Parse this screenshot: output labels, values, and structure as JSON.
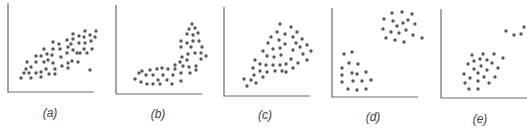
{
  "chart_data": {
    "type": "scatter",
    "title": "",
    "grid": false,
    "legend": null,
    "panels": [
      {
        "label": "(a)",
        "description": "positive linear correlation with one outlier",
        "axis": {
          "x0": 8,
          "y0": 92,
          "x1": 94,
          "ytop": 3
        },
        "label_pos": [
          50,
          117
        ],
        "points": [
          [
            21,
            78
          ],
          [
            26,
            69
          ],
          [
            24,
            73
          ],
          [
            31,
            78
          ],
          [
            29,
            73
          ],
          [
            27,
            62
          ],
          [
            31,
            67
          ],
          [
            36,
            56
          ],
          [
            36,
            62
          ],
          [
            36,
            73
          ],
          [
            41,
            56
          ],
          [
            41,
            72
          ],
          [
            41,
            77
          ],
          [
            44,
            49
          ],
          [
            44,
            62
          ],
          [
            46,
            69
          ],
          [
            47,
            54
          ],
          [
            48,
            60
          ],
          [
            49,
            74
          ],
          [
            53,
            42
          ],
          [
            53,
            49
          ],
          [
            52,
            55
          ],
          [
            53,
            63
          ],
          [
            55,
            69
          ],
          [
            55,
            74
          ],
          [
            59,
            44
          ],
          [
            60,
            49
          ],
          [
            61,
            57
          ],
          [
            62,
            66
          ],
          [
            67,
            40
          ],
          [
            68,
            47
          ],
          [
            67,
            53
          ],
          [
            68,
            63
          ],
          [
            68,
            68
          ],
          [
            73,
            34
          ],
          [
            73,
            39
          ],
          [
            71,
            44
          ],
          [
            72,
            61
          ],
          [
            79,
            36
          ],
          [
            79,
            43
          ],
          [
            77,
            53
          ],
          [
            78,
            62
          ],
          [
            85,
            31
          ],
          [
            84,
            37
          ],
          [
            85,
            43
          ],
          [
            84,
            49
          ],
          [
            87,
            53
          ],
          [
            90,
            35
          ],
          [
            91,
            41
          ],
          [
            92,
            49
          ],
          [
            96,
            31
          ],
          [
            95,
            37
          ],
          [
            90,
            70
          ],
          [
            80,
            53
          ],
          [
            73,
            50
          ]
        ]
      },
      {
        "label": "(b)",
        "description": "nonlinear (curved) relationship",
        "axis": {
          "x0": 116,
          "y0": 94,
          "x1": 202,
          "ytop": 5
        },
        "label_pos": [
          158,
          118
        ],
        "points": [
          [
            135,
            79
          ],
          [
            139,
            73
          ],
          [
            142,
            71
          ],
          [
            141,
            82
          ],
          [
            146,
            75
          ],
          [
            147,
            84
          ],
          [
            150,
            70
          ],
          [
            153,
            84
          ],
          [
            153,
            75
          ],
          [
            157,
            69
          ],
          [
            158,
            80
          ],
          [
            160,
            84
          ],
          [
            162,
            68
          ],
          [
            163,
            75
          ],
          [
            167,
            80
          ],
          [
            168,
            69
          ],
          [
            172,
            84
          ],
          [
            173,
            75
          ],
          [
            175,
            69
          ],
          [
            175,
            65
          ],
          [
            181,
            81
          ],
          [
            181,
            73
          ],
          [
            180,
            62
          ],
          [
            183,
            66
          ],
          [
            182,
            57
          ],
          [
            187,
            60
          ],
          [
            189,
            67
          ],
          [
            190,
            73
          ],
          [
            196,
            70
          ],
          [
            196,
            66
          ],
          [
            188,
            54
          ],
          [
            195,
            53
          ],
          [
            201,
            53
          ],
          [
            201,
            59
          ],
          [
            206,
            56
          ],
          [
            181,
            47
          ],
          [
            181,
            41
          ],
          [
            187,
            43
          ],
          [
            193,
            41
          ],
          [
            199,
            41
          ],
          [
            202,
            47
          ],
          [
            191,
            47
          ],
          [
            187,
            34
          ],
          [
            193,
            35
          ],
          [
            198,
            33
          ],
          [
            189,
            29
          ],
          [
            195,
            28
          ],
          [
            192,
            24
          ]
        ]
      },
      {
        "label": "(c)",
        "description": "heteroscedastic positive relationship (fan shape)",
        "axis": {
          "x0": 224,
          "y0": 96,
          "x1": 310,
          "ytop": 7
        },
        "label_pos": [
          265,
          119
        ],
        "points": [
          [
            244,
            79
          ],
          [
            247,
            86
          ],
          [
            251,
            80
          ],
          [
            256,
            83
          ],
          [
            254,
            75
          ],
          [
            253,
            68
          ],
          [
            255,
            60
          ],
          [
            260,
            64
          ],
          [
            260,
            71
          ],
          [
            263,
            77
          ],
          [
            267,
            72
          ],
          [
            266,
            65
          ],
          [
            267,
            56
          ],
          [
            263,
            51
          ],
          [
            268,
            43
          ],
          [
            271,
            37
          ],
          [
            273,
            49
          ],
          [
            274,
            57
          ],
          [
            273,
            65
          ],
          [
            275,
            71
          ],
          [
            277,
            32
          ],
          [
            279,
            40
          ],
          [
            280,
            48
          ],
          [
            281,
            55
          ],
          [
            280,
            65
          ],
          [
            280,
            24
          ],
          [
            285,
            34
          ],
          [
            285,
            44
          ],
          [
            286,
            64
          ],
          [
            286,
            72
          ],
          [
            282,
            71
          ],
          [
            291,
            27
          ],
          [
            293,
            37
          ],
          [
            293,
            50
          ],
          [
            291,
            59
          ],
          [
            293,
            68
          ],
          [
            297,
            32
          ],
          [
            296,
            43
          ],
          [
            300,
            47
          ],
          [
            298,
            63
          ],
          [
            302,
            39
          ],
          [
            303,
            54
          ],
          [
            307,
            45
          ],
          [
            311,
            51
          ],
          [
            307,
            60
          ]
        ]
      },
      {
        "label": "(d)",
        "description": "two separate clusters",
        "axis": {
          "x0": 332,
          "y0": 97,
          "x1": 418,
          "ytop": 8
        },
        "label_pos": [
          373,
          121
        ],
        "points": [
          [
            344,
            54
          ],
          [
            352,
            52
          ],
          [
            349,
            63
          ],
          [
            358,
            64
          ],
          [
            342,
            68
          ],
          [
            352,
            73
          ],
          [
            357,
            74
          ],
          [
            366,
            72
          ],
          [
            342,
            75
          ],
          [
            353,
            81
          ],
          [
            362,
            81
          ],
          [
            371,
            80
          ],
          [
            342,
            82
          ],
          [
            348,
            89
          ],
          [
            357,
            90
          ],
          [
            366,
            89
          ],
          [
            392,
            13
          ],
          [
            402,
            12
          ],
          [
            412,
            14
          ],
          [
            384,
            19
          ],
          [
            393,
            21
          ],
          [
            403,
            23
          ],
          [
            408,
            20
          ],
          [
            397,
            26
          ],
          [
            415,
            24
          ],
          [
            383,
            29
          ],
          [
            391,
            32
          ],
          [
            399,
            33
          ],
          [
            406,
            30
          ],
          [
            413,
            35
          ],
          [
            386,
            38
          ],
          [
            395,
            40
          ],
          [
            404,
            42
          ],
          [
            422,
            38
          ]
        ]
      },
      {
        "label": "(e)",
        "description": "main cluster with a small group of outliers",
        "axis": {
          "x0": 441,
          "y0": 98,
          "x1": 527,
          "ytop": 9
        },
        "label_pos": [
          480,
          123
        ],
        "points": [
          [
            472,
            55
          ],
          [
            483,
            54
          ],
          [
            494,
            54
          ],
          [
            468,
            64
          ],
          [
            474,
            61
          ],
          [
            480,
            59
          ],
          [
            487,
            60
          ],
          [
            492,
            63
          ],
          [
            503,
            58
          ],
          [
            474,
            69
          ],
          [
            481,
            66
          ],
          [
            487,
            70
          ],
          [
            498,
            68
          ],
          [
            464,
            74
          ],
          [
            470,
            78
          ],
          [
            478,
            73
          ],
          [
            484,
            77
          ],
          [
            495,
            77
          ],
          [
            465,
            83
          ],
          [
            478,
            81
          ],
          [
            489,
            83
          ],
          [
            469,
            89
          ],
          [
            478,
            89
          ],
          [
            506,
            31
          ],
          [
            514,
            35
          ],
          [
            521,
            34
          ],
          [
            524,
            27
          ]
        ]
      }
    ],
    "xlabel": "",
    "ylabel": "",
    "colors": {
      "dot": "#585858",
      "axis": "#6a6a6a",
      "label": "#444444"
    }
  },
  "labels": {
    "a": "(a)",
    "b": "(b)",
    "c": "(c)",
    "d": "(d)",
    "e": "(e)"
  }
}
